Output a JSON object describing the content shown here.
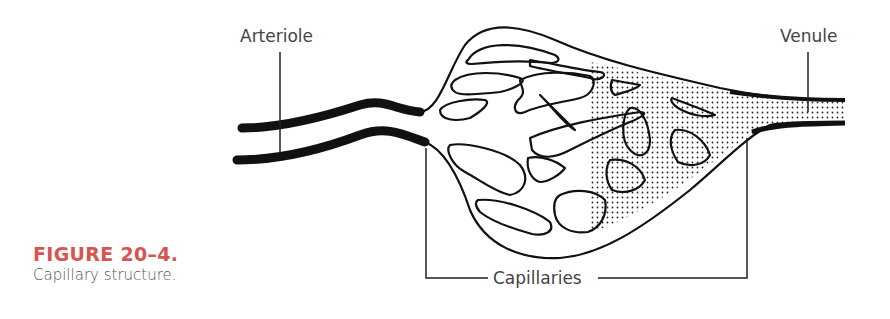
{
  "figure": {
    "number": "FIGURE 20–4.",
    "title": "Capillary structure.",
    "accent_color": "#d9534f"
  },
  "diagram": {
    "labels": {
      "arteriole": "Arteriole",
      "venule": "Venule",
      "capillaries": "Capillaries"
    }
  }
}
